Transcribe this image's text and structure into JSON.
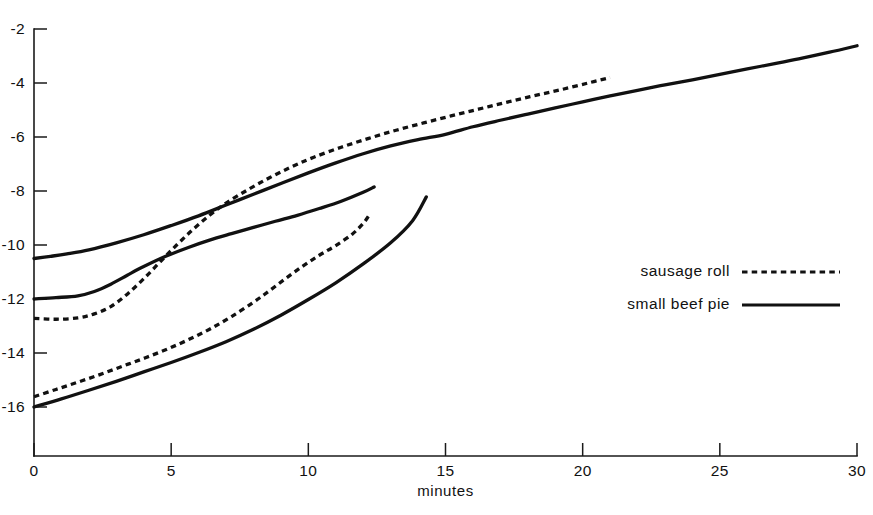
{
  "chart_data": {
    "type": "line",
    "title": "",
    "subtitle": "",
    "xlabel": "minutes",
    "ylabel": "",
    "xlim": [
      0,
      30
    ],
    "ylim": [
      -17.0,
      -1.6
    ],
    "xticks": [
      0,
      5,
      10,
      15,
      20,
      25,
      30
    ],
    "xticklabels": [
      "0",
      "5",
      "10",
      "15",
      "20",
      "25",
      "30"
    ],
    "yticks": [
      -2,
      -4,
      -6,
      -8,
      -10,
      -12,
      -14,
      -16
    ],
    "yticklabels": [
      "-2",
      "-4",
      "-6",
      "-8",
      "-10",
      "-12",
      "-14",
      "-16"
    ],
    "grid": false,
    "legend_position": "center-right",
    "legend": [
      {
        "label": "sausage roll",
        "style": "dotted"
      },
      {
        "label": "small beef pie",
        "style": "solid"
      }
    ],
    "series": [
      {
        "name": "small beef pie - curve 1",
        "style": "solid",
        "points": [
          [
            0.0,
            -10.5
          ],
          [
            0.6,
            -10.42
          ],
          [
            1.2,
            -10.33
          ],
          [
            2.0,
            -10.18
          ],
          [
            3.0,
            -9.92
          ],
          [
            4.0,
            -9.62
          ],
          [
            5.0,
            -9.28
          ],
          [
            6.0,
            -8.92
          ],
          [
            7.0,
            -8.52
          ],
          [
            8.0,
            -8.12
          ],
          [
            9.0,
            -7.72
          ],
          [
            10.0,
            -7.33
          ],
          [
            11.0,
            -6.96
          ],
          [
            12.0,
            -6.62
          ],
          [
            13.0,
            -6.33
          ],
          [
            14.0,
            -6.1
          ],
          [
            15.0,
            -5.9
          ],
          [
            16.0,
            -5.62
          ],
          [
            17.0,
            -5.38
          ],
          [
            18.0,
            -5.15
          ],
          [
            19.0,
            -4.92
          ],
          [
            20.0,
            -4.7
          ],
          [
            21.0,
            -4.48
          ],
          [
            22.0,
            -4.27
          ],
          [
            23.0,
            -4.07
          ],
          [
            24.0,
            -3.88
          ],
          [
            25.0,
            -3.68
          ],
          [
            26.0,
            -3.48
          ],
          [
            27.0,
            -3.28
          ],
          [
            28.0,
            -3.08
          ],
          [
            29.0,
            -2.86
          ],
          [
            30.0,
            -2.62
          ]
        ]
      },
      {
        "name": "sausage roll - curve 1",
        "style": "dotted",
        "points": [
          [
            0.0,
            -12.72
          ],
          [
            0.8,
            -12.75
          ],
          [
            1.6,
            -12.7
          ],
          [
            2.2,
            -12.55
          ],
          [
            2.8,
            -12.28
          ],
          [
            3.4,
            -11.82
          ],
          [
            4.0,
            -11.25
          ],
          [
            4.6,
            -10.62
          ],
          [
            5.2,
            -10.0
          ],
          [
            5.8,
            -9.42
          ],
          [
            6.4,
            -8.9
          ],
          [
            7.0,
            -8.45
          ],
          [
            7.8,
            -7.95
          ],
          [
            8.6,
            -7.5
          ],
          [
            9.4,
            -7.1
          ],
          [
            10.2,
            -6.75
          ],
          [
            11.2,
            -6.38
          ],
          [
            12.2,
            -6.05
          ],
          [
            13.2,
            -5.75
          ],
          [
            14.2,
            -5.48
          ],
          [
            15.2,
            -5.22
          ],
          [
            16.2,
            -4.97
          ],
          [
            17.2,
            -4.72
          ],
          [
            18.2,
            -4.48
          ],
          [
            19.2,
            -4.25
          ],
          [
            20.2,
            -4.0
          ],
          [
            21.0,
            -3.8
          ]
        ]
      },
      {
        "name": "small beef pie - curve 2",
        "style": "solid",
        "points": [
          [
            0.0,
            -12.0
          ],
          [
            0.8,
            -11.95
          ],
          [
            1.6,
            -11.88
          ],
          [
            2.2,
            -11.72
          ],
          [
            2.8,
            -11.45
          ],
          [
            3.4,
            -11.12
          ],
          [
            4.0,
            -10.8
          ],
          [
            4.8,
            -10.42
          ],
          [
            5.6,
            -10.1
          ],
          [
            6.4,
            -9.82
          ],
          [
            7.2,
            -9.58
          ],
          [
            8.0,
            -9.35
          ],
          [
            8.8,
            -9.12
          ],
          [
            9.6,
            -8.9
          ],
          [
            10.4,
            -8.65
          ],
          [
            11.2,
            -8.38
          ],
          [
            12.0,
            -8.05
          ],
          [
            12.4,
            -7.85
          ]
        ]
      },
      {
        "name": "sausage roll - curve 2",
        "style": "dotted",
        "points": [
          [
            0.0,
            -15.62
          ],
          [
            0.8,
            -15.35
          ],
          [
            1.6,
            -15.08
          ],
          [
            2.4,
            -14.8
          ],
          [
            3.2,
            -14.5
          ],
          [
            4.0,
            -14.2
          ],
          [
            4.8,
            -13.88
          ],
          [
            5.6,
            -13.52
          ],
          [
            6.4,
            -13.12
          ],
          [
            7.2,
            -12.65
          ],
          [
            8.0,
            -12.12
          ],
          [
            8.6,
            -11.68
          ],
          [
            9.2,
            -11.22
          ],
          [
            9.8,
            -10.78
          ],
          [
            10.4,
            -10.38
          ],
          [
            11.0,
            -10.02
          ],
          [
            11.6,
            -9.6
          ],
          [
            12.0,
            -9.2
          ],
          [
            12.2,
            -8.92
          ]
        ]
      },
      {
        "name": "small beef pie - curve 3",
        "style": "solid",
        "points": [
          [
            0.0,
            -16.0
          ],
          [
            1.0,
            -15.7
          ],
          [
            2.0,
            -15.38
          ],
          [
            3.0,
            -15.05
          ],
          [
            4.0,
            -14.7
          ],
          [
            5.0,
            -14.35
          ],
          [
            6.0,
            -13.98
          ],
          [
            7.0,
            -13.58
          ],
          [
            8.0,
            -13.12
          ],
          [
            9.0,
            -12.6
          ],
          [
            10.0,
            -12.02
          ],
          [
            11.0,
            -11.4
          ],
          [
            12.0,
            -10.7
          ],
          [
            13.0,
            -9.92
          ],
          [
            13.8,
            -9.1
          ],
          [
            14.3,
            -8.22
          ]
        ]
      }
    ]
  },
  "axis": {
    "x_title": "minutes"
  },
  "legend": {
    "entries": [
      {
        "label": "sausage roll",
        "style": "dotted"
      },
      {
        "label": "small beef pie",
        "style": "solid"
      }
    ]
  }
}
